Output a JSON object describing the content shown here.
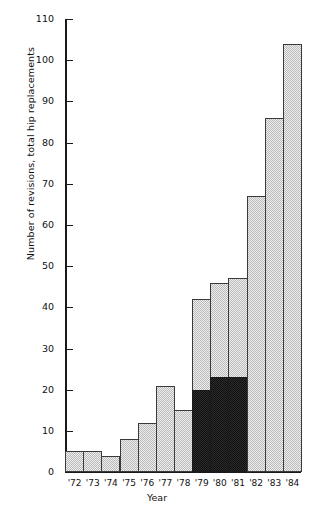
{
  "chart_data": {
    "type": "bar",
    "title": "",
    "xlabel": "Year",
    "ylabel": "Number of revisions, total hip replacements",
    "categories": [
      "'72",
      "'73",
      "'74",
      "'75",
      "'76",
      "'77",
      "'78",
      "'79",
      "'80",
      "'81",
      "'82",
      "'83",
      "'84"
    ],
    "ylim": [
      0,
      110
    ],
    "ytick_step": 10,
    "yticks": [
      0,
      10,
      20,
      30,
      40,
      50,
      60,
      70,
      80,
      90,
      100,
      110
    ],
    "grid": false,
    "legend": null,
    "series": [
      {
        "name": "Total revisions",
        "values": [
          5,
          5,
          4,
          8,
          12,
          21,
          15,
          42,
          46,
          47,
          67,
          86,
          104
        ],
        "fill": "light-stipple",
        "color": "#efefef"
      },
      {
        "name": "Highlighted subset",
        "values": [
          null,
          null,
          null,
          null,
          null,
          null,
          null,
          20,
          23,
          23,
          null,
          null,
          null
        ],
        "fill": "dark-stipple",
        "color": "#2b2b2b"
      }
    ]
  }
}
